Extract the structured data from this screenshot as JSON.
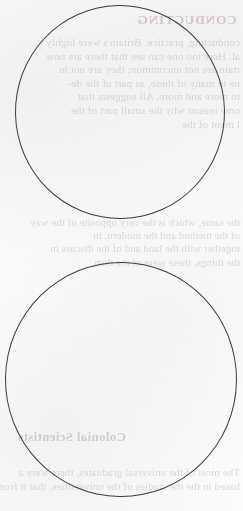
{
  "page": {
    "kind": "scanned-book-page",
    "paper_color": "#fdfdfd",
    "ink_color": "#8e8c8d",
    "annotation_color": "#3b3a3c",
    "heading_color": "#a98478"
  },
  "bleed_through": {
    "note": "Text visible through the paper from the reverse side; renders mirrored.",
    "header_title": "CONDUCTING",
    "top_block": [
      "conducting, practice. Britain's were highly",
      "al. Here too one can see that there are now",
      "rtain are not uncommon; they are not in",
      "ne to many of these, as part of the de-",
      "to more and more. All suggests that",
      "ome reason why the small part of the",
      "l ment of the"
    ],
    "mid_block": [
      "the same, which is the very opposite of the way",
      "of the method and the modern, in",
      "together with the land and of the discuss in",
      "the things, these were of the then,"
    ],
    "section_heading": "Colonial Scientists",
    "bottom_block": [
      "The most of the universal graduates, there were a",
      "based in the the studies of the universities, that it from"
    ]
  },
  "annotations": {
    "shapes": [
      {
        "name": "circle-top",
        "type": "circle",
        "center_x": 120,
        "center_y": 112,
        "diameter": 212,
        "stroke_color": "#3b3a3c",
        "stroke_width": 1.15
      },
      {
        "name": "circle-bottom",
        "type": "circle",
        "center_x": 121,
        "center_y": 379,
        "diameter": 233,
        "stroke_color": "#3b3a3c",
        "stroke_width": 1.15
      }
    ]
  }
}
